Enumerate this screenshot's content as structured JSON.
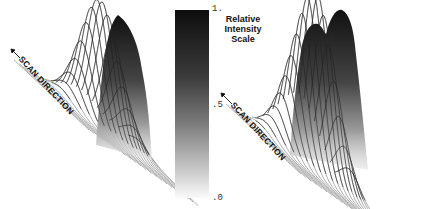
{
  "scale": {
    "title_lines": [
      "Relative",
      "Intensity",
      "Scale"
    ],
    "ticks": [
      {
        "label": "1.",
        "value": 1.0
      },
      {
        "label": ".5",
        "value": 0.5
      },
      {
        "label": ".0",
        "value": 0.0
      }
    ],
    "gradient_top": "#111111",
    "gradient_bottom": "#ffffff"
  },
  "plots": [
    {
      "id": "left",
      "axis_label": "SCAN DIRECTION",
      "peak_type": "single"
    },
    {
      "id": "right",
      "axis_label": "SCAN DIRECTION",
      "peak_type": "double"
    }
  ]
}
